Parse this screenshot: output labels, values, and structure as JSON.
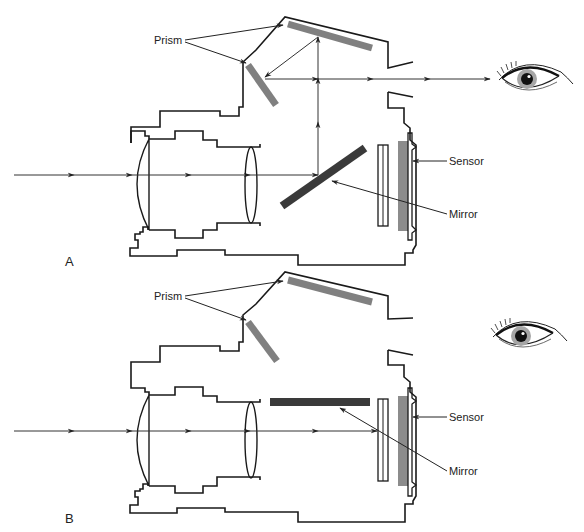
{
  "figure": {
    "colors": {
      "outline": "#1a1a1a",
      "ray": "#333333",
      "prism": "#808080",
      "mirror": "#3a3a3a",
      "sensor": "#8c8c8c",
      "iris": "#9a9a9a",
      "pupil": "#111111"
    }
  },
  "panels": [
    {
      "id": "A",
      "letter": "A",
      "mirror_state": "down (45°, light reflected up to prism and eyepiece)",
      "labels": {
        "prism": "Prism",
        "sensor": "Sensor",
        "mirror": "Mirror"
      },
      "eye_icon": "eye-icon"
    },
    {
      "id": "B",
      "letter": "B",
      "mirror_state": "up (horizontal, light passes to sensor)",
      "labels": {
        "prism": "Prism",
        "sensor": "Sensor",
        "mirror": "Mirror"
      },
      "eye_icon": "eye-icon"
    }
  ]
}
